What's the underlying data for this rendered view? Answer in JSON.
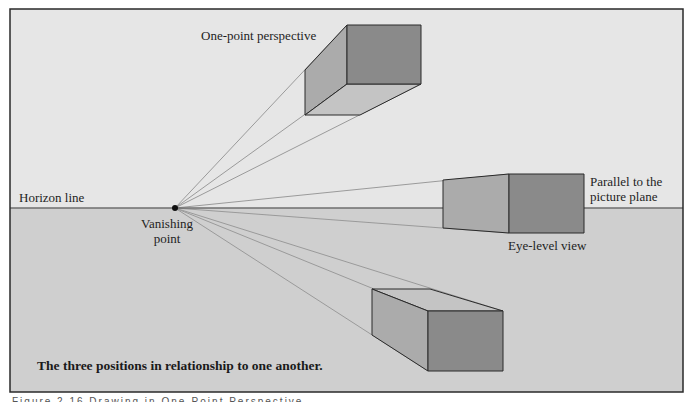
{
  "diagram": {
    "title_label": "One-point perspective",
    "horizon_label": "Horizon line",
    "vanishing_point_label_line1": "Vanishing",
    "vanishing_point_label_line2": "point",
    "parallel_label_line1": "Parallel to the",
    "parallel_label_line2": "picture plane",
    "eye_level_label": "Eye-level view",
    "inner_caption": "The three positions in relationship to one another.",
    "figure_caption_partial": "Figure 2.16 Drawing in One-Point Perspective",
    "colors": {
      "sky": "#e6e6e6",
      "ground": "#cfcfcf",
      "frame": "#2a2a2a",
      "horizon": "#6e6e6e",
      "guide_lines": "#9a9a9a",
      "front_face": "#8a8a8a",
      "side_face": "#ababab",
      "top_face": "#c4c4c4",
      "edge": "#2a2a2a",
      "vanishing_point": "#111111"
    },
    "vanishing_point": {
      "x": 175,
      "y": 208
    },
    "horizon_y": 208,
    "boxes": [
      {
        "name": "above-horizon-box",
        "front": [
          347,
          25,
          421,
          84
        ],
        "back_left_x": 305,
        "back_top_y": 70,
        "back_bottom_y": 115
      },
      {
        "name": "eye-level-box",
        "front": [
          509,
          174,
          584,
          233
        ],
        "back_left_x": 443,
        "back_top_y": 180,
        "back_bottom_y": 228
      },
      {
        "name": "below-horizon-box",
        "front": [
          428,
          311,
          503,
          371
        ],
        "back_left_x": 372,
        "back_top_y": 289,
        "back_bottom_y": 335
      }
    ]
  }
}
